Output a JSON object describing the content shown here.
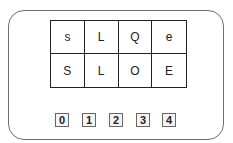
{
  "grid": {
    "rows": [
      [
        "s",
        "L",
        "Q",
        "e"
      ],
      [
        "S",
        "L",
        "O",
        "E"
      ]
    ]
  },
  "buttons": [
    "0",
    "1",
    "2",
    "3",
    "4"
  ]
}
